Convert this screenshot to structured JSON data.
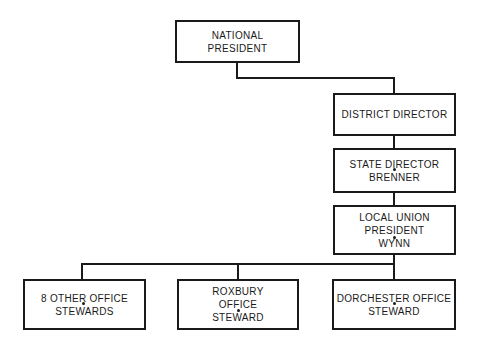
{
  "diagram": {
    "type": "org-chart",
    "nodes": [
      {
        "id": "national",
        "lines": [
          "NATIONAL",
          "PRESIDENT"
        ]
      },
      {
        "id": "district",
        "lines": [
          "DISTRICT DIRECTOR"
        ]
      },
      {
        "id": "state",
        "lines": [
          "STATE DIRECTOR",
          "BRENNER"
        ]
      },
      {
        "id": "local",
        "lines": [
          "LOCAL UNION",
          "PRESIDENT",
          "WYNN"
        ]
      },
      {
        "id": "other",
        "lines": [
          "8 OTHER OFFICE",
          "STEWARDS"
        ]
      },
      {
        "id": "roxbury",
        "lines": [
          "ROXBURY",
          "OFFICE",
          "STEWARD"
        ]
      },
      {
        "id": "dorchester",
        "lines": [
          "DORCHESTER OFFICE",
          "STEWARD"
        ]
      }
    ],
    "edges": [
      [
        "national",
        "district"
      ],
      [
        "district",
        "state"
      ],
      [
        "state",
        "local"
      ],
      [
        "local",
        "other"
      ],
      [
        "local",
        "roxbury"
      ],
      [
        "local",
        "dorchester"
      ]
    ],
    "colors": {
      "line": "#1a1a1a",
      "background": "#ffffff"
    }
  }
}
